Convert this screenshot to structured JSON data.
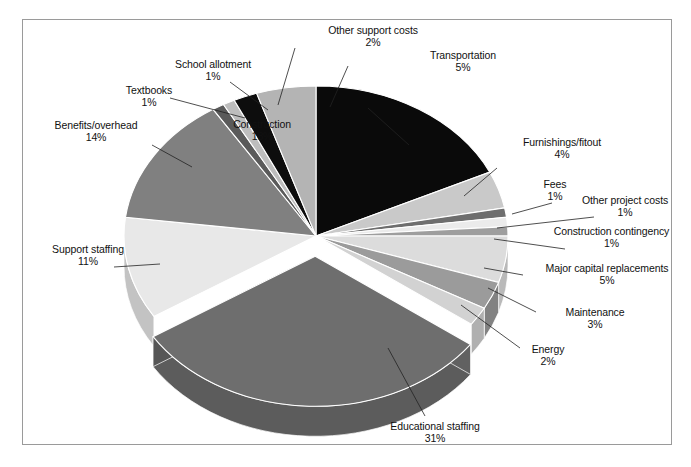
{
  "figure": {
    "title": "",
    "border_color": "#9a9a9a",
    "background": "#ffffff"
  },
  "chart_data": {
    "type": "pie",
    "title": "",
    "xlabel": "",
    "ylabel": "",
    "units": "percent",
    "three_d": true,
    "exploded_slice": "Educational staffing",
    "legend_position": "none (direct labels with leader lines)",
    "categories": [
      "Construction",
      "Furnishings/fitout",
      "Fees",
      "Other project costs",
      "Construction contingency",
      "Major capital replacements",
      "Maintenance",
      "Energy",
      "Educational staffing",
      "Support staffing",
      "Benefits/overhead",
      "Textbooks",
      "School allotment",
      "Other support costs",
      "Transportation"
    ],
    "values": [
      18,
      4,
      1,
      1,
      1,
      5,
      3,
      2,
      31,
      11,
      14,
      1,
      1,
      2,
      5
    ],
    "value_labels": [
      "18%",
      "4%",
      "1%",
      "1%",
      "1%",
      "5%",
      "3%",
      "2%",
      "31%",
      "11%",
      "14%",
      "1%",
      "1%",
      "2%",
      "5%"
    ],
    "colors": [
      "#0a0a0a",
      "#c9c9c9",
      "#6e6e6e",
      "#ebebeb",
      "#9e9e9e",
      "#dcdcdc",
      "#9b9b9b",
      "#d2d2d2",
      "#6e6e6e",
      "#e8e8e8",
      "#808080",
      "#5a5a5a",
      "#bdbdbd",
      "#0d0d0d",
      "#b4b4b4"
    ]
  },
  "labels": [
    {
      "id": "construction",
      "name": "Construction",
      "value": "18%"
    },
    {
      "id": "furnishings-fitout",
      "name": "Furnishings/fitout",
      "value": "4%"
    },
    {
      "id": "fees",
      "name": "Fees",
      "value": "1%"
    },
    {
      "id": "other-project-costs",
      "name": "Other project costs",
      "value": "1%"
    },
    {
      "id": "construction-contingency",
      "name": "Construction contingency",
      "value": "1%"
    },
    {
      "id": "major-capital-replacements",
      "name": "Major capital replacements",
      "value": "5%"
    },
    {
      "id": "maintenance",
      "name": "Maintenance",
      "value": "3%"
    },
    {
      "id": "energy",
      "name": "Energy",
      "value": "2%"
    },
    {
      "id": "educational-staffing",
      "name": "Educational staffing",
      "value": "31%"
    },
    {
      "id": "support-staffing",
      "name": "Support staffing",
      "value": "11%"
    },
    {
      "id": "benefits-overhead",
      "name": "Benefits/overhead",
      "value": "14%"
    },
    {
      "id": "textbooks",
      "name": "Textbooks",
      "value": "1%"
    },
    {
      "id": "school-allotment",
      "name": "School allotment",
      "value": "1%"
    },
    {
      "id": "other-support-costs",
      "name": "Other support costs",
      "value": "2%"
    },
    {
      "id": "transportation",
      "name": "Transportation",
      "value": "5%"
    }
  ]
}
